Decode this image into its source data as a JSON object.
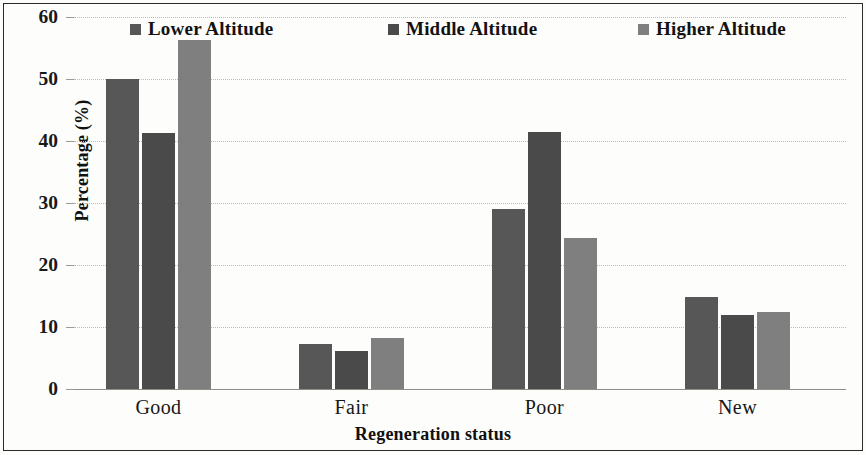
{
  "chart_data": {
    "type": "bar",
    "title": "",
    "xlabel": "Regeneration status",
    "ylabel": "Percentage (%)",
    "categories": [
      "Good",
      "Fair",
      "Poor",
      "New"
    ],
    "series": [
      {
        "name": "Lower Altitude",
        "color": "#575757",
        "values": [
          50.0,
          7.3,
          29.0,
          14.9
        ]
      },
      {
        "name": "Middle Altitude",
        "color": "#4a4a4a",
        "values": [
          41.3,
          6.1,
          41.4,
          12.0
        ]
      },
      {
        "name": "Higher Altitude",
        "color": "#7f7f7f",
        "values": [
          56.3,
          8.2,
          24.3,
          12.4
        ]
      }
    ],
    "ylim": [
      0,
      60
    ],
    "yticks": [
      0,
      10,
      20,
      30,
      40,
      50,
      60
    ],
    "ytick_labels": [
      "0",
      "10",
      "20",
      "30",
      "40",
      "50",
      "60"
    ],
    "grid": true,
    "legend_position": "top"
  },
  "legend": {
    "items": [
      {
        "label": "Lower Altitude",
        "swatch": "legend-swatch-lower"
      },
      {
        "label": "Middle Altitude",
        "swatch": "legend-swatch-middle"
      },
      {
        "label": "Higher Altitude",
        "swatch": "legend-swatch-higher"
      }
    ]
  },
  "axes": {
    "y_title": "Percentage (%)",
    "x_title": "Regeneration status"
  }
}
